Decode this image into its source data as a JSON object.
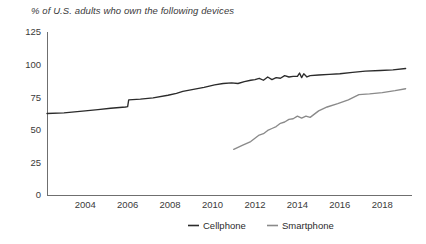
{
  "chart_data": {
    "type": "line",
    "title": "% of U.S. adults who own the following devices",
    "xlabel": "",
    "ylabel": "",
    "grid": false,
    "legend_position": "bottom-center",
    "xlim": [
      2002.2,
      2019.4
    ],
    "ylim": [
      0,
      125
    ],
    "y_ticks": [
      0,
      25,
      50,
      75,
      100,
      125
    ],
    "x_ticks": [
      2004,
      2006,
      2008,
      2010,
      2012,
      2014,
      2016,
      2018
    ],
    "y_tick_labels": [
      "0",
      "25",
      "50",
      "75",
      "100",
      "125"
    ],
    "x_tick_labels": [
      "2004",
      "2006",
      "2008",
      "2010",
      "2012",
      "2014",
      "2016",
      "2018"
    ],
    "colors": {
      "cellphone": "#2b2b2b",
      "smartphone": "#8a8a8a",
      "axis": "#6f6f6f",
      "text": "#3a3a3a"
    },
    "series": [
      {
        "name": "Cellphone",
        "color": "#2b2b2b",
        "x": [
          2002.2,
          2003.0,
          2004.0,
          2004.6,
          2005.2,
          2005.9,
          2006.0,
          2006.05,
          2006.6,
          2007.2,
          2007.9,
          2008.3,
          2008.6,
          2009.1,
          2009.6,
          2010.1,
          2010.5,
          2010.9,
          2011.2,
          2011.5,
          2011.8,
          2012.0,
          2012.2,
          2012.4,
          2012.6,
          2012.8,
          2013.0,
          2013.2,
          2013.4,
          2013.6,
          2013.8,
          2014.0,
          2014.1,
          2014.2,
          2014.3,
          2014.45,
          2014.6,
          2015.0,
          2015.5,
          2016.0,
          2016.6,
          2017.2,
          2017.9,
          2018.5,
          2019.1
        ],
        "y": [
          62.5,
          63.0,
          64.5,
          65.5,
          66.5,
          67.5,
          67.8,
          73.0,
          73.5,
          74.5,
          76.5,
          78.0,
          79.5,
          81.0,
          82.5,
          84.5,
          85.5,
          86.0,
          85.5,
          87.0,
          88.0,
          88.5,
          89.5,
          88.0,
          90.5,
          88.5,
          90.0,
          89.5,
          91.5,
          90.5,
          91.0,
          91.0,
          93.5,
          90.0,
          93.0,
          90.5,
          91.5,
          92.0,
          92.5,
          93.0,
          94.0,
          95.0,
          95.5,
          96.0,
          97.0
        ]
      },
      {
        "name": "Smartphone",
        "color": "#8a8a8a",
        "x": [
          2011.0,
          2011.4,
          2011.8,
          2012.0,
          2012.2,
          2012.4,
          2012.6,
          2012.8,
          2013.0,
          2013.2,
          2013.4,
          2013.6,
          2013.8,
          2014.0,
          2014.2,
          2014.4,
          2014.6,
          2014.8,
          2015.0,
          2015.4,
          2015.9,
          2016.4,
          2016.9,
          2017.4,
          2018.0,
          2018.6,
          2019.1
        ],
        "y": [
          35.0,
          38.0,
          41.0,
          43.5,
          46.0,
          47.0,
          49.5,
          51.0,
          52.5,
          55.0,
          56.0,
          58.0,
          58.5,
          60.5,
          59.0,
          60.5,
          59.5,
          62.0,
          64.5,
          67.5,
          70.0,
          73.0,
          77.0,
          77.5,
          78.5,
          80.0,
          81.5
        ]
      }
    ]
  },
  "legend": {
    "items": [
      {
        "label": "Cellphone",
        "color": "#2b2b2b"
      },
      {
        "label": "Smartphone",
        "color": "#8a8a8a"
      }
    ]
  }
}
